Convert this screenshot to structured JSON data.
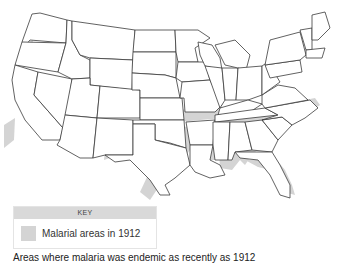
{
  "map": {
    "subject": "United States map showing malarial areas",
    "highlight_color": "#d4d4d4",
    "highlighted_regions": [
      "California Central Valley",
      "Oregon Willamette Valley",
      "Washington Puget Sound",
      "Arizona/New Mexico",
      "Texas",
      "Oklahoma",
      "Arkansas",
      "Louisiana",
      "Mississippi",
      "Alabama",
      "Georgia",
      "Florida",
      "South Carolina",
      "North Carolina",
      "Tennessee",
      "Kentucky",
      "Virginia"
    ]
  },
  "key": {
    "title": "KEY",
    "items": [
      {
        "label": "Malarial areas in 1912",
        "color": "#d4d4d4"
      }
    ]
  },
  "caption": "Areas where malaria was endemic as recently as 1912"
}
